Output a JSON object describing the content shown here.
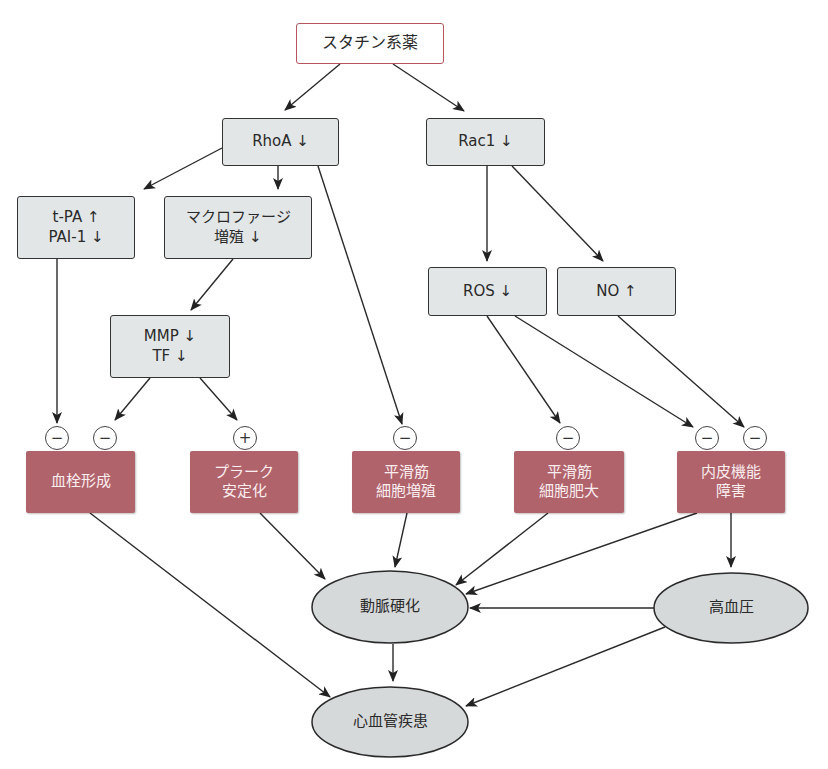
{
  "diagram": {
    "root": {
      "label": "スタチン系薬"
    },
    "level1": [
      {
        "id": "rhoa",
        "label": "RhoA ↓"
      },
      {
        "id": "rac1",
        "label": "Rac1 ↓"
      }
    ],
    "mediators": {
      "tpa": {
        "line1": "t-PA ↑",
        "line2": "PAI-1 ↓"
      },
      "macrophage": {
        "line1": "マクロファージ",
        "line2": "増殖 ↓"
      },
      "mmp": {
        "line1": "MMP ↓",
        "line2": "TF ↓"
      },
      "ros": {
        "label": "ROS ↓"
      },
      "no": {
        "label": "NO ↑"
      }
    },
    "effects": [
      {
        "id": "thrombus",
        "line1": "血栓形成",
        "line2": ""
      },
      {
        "id": "plaque",
        "line1": "プラーク",
        "line2": "安定化"
      },
      {
        "id": "smc_prolif",
        "line1": "平滑筋",
        "line2": "細胞増殖"
      },
      {
        "id": "smc_hyper",
        "line1": "平滑筋",
        "line2": "細胞肥大"
      },
      {
        "id": "endothelial",
        "line1": "内皮機能",
        "line2": "障害"
      }
    ],
    "signs": {
      "thrombus_a": "−",
      "thrombus_b": "−",
      "plaque": "+",
      "smc_prolif": "−",
      "smc_hyper": "−",
      "endothelial_a": "−",
      "endothelial_b": "−"
    },
    "outcomes": [
      {
        "id": "atherosclerosis",
        "label": "動脈硬化"
      },
      {
        "id": "hypertension",
        "label": "高血圧"
      },
      {
        "id": "cvd",
        "label": "心血管疾患"
      }
    ],
    "edges": [
      [
        "スタチン系薬",
        "RhoA ↓"
      ],
      [
        "スタチン系薬",
        "Rac1 ↓"
      ],
      [
        "RhoA ↓",
        "t-PA ↑ / PAI-1 ↓"
      ],
      [
        "RhoA ↓",
        "マクロファージ増殖 ↓"
      ],
      [
        "RhoA ↓",
        "平滑筋細胞増殖 (−)"
      ],
      [
        "マクロファージ増殖 ↓",
        "MMP ↓ / TF ↓"
      ],
      [
        "t-PA ↑ / PAI-1 ↓",
        "血栓形成 (−)"
      ],
      [
        "MMP ↓ / TF ↓",
        "血栓形成 (−)"
      ],
      [
        "MMP ↓ / TF ↓",
        "プラーク安定化 (+)"
      ],
      [
        "Rac1 ↓",
        "ROS ↓"
      ],
      [
        "Rac1 ↓",
        "NO ↑"
      ],
      [
        "ROS ↓",
        "平滑筋細胞肥大 (−)"
      ],
      [
        "ROS ↓",
        "内皮機能障害 (−)"
      ],
      [
        "NO ↑",
        "内皮機能障害 (−)"
      ],
      [
        "血栓形成",
        "心血管疾患"
      ],
      [
        "プラーク安定化",
        "動脈硬化"
      ],
      [
        "平滑筋細胞増殖",
        "動脈硬化"
      ],
      [
        "平滑筋細胞肥大",
        "動脈硬化"
      ],
      [
        "内皮機能障害",
        "動脈硬化"
      ],
      [
        "内皮機能障害",
        "高血圧"
      ],
      [
        "高血圧",
        "動脈硬化"
      ],
      [
        "高血圧",
        "心血管疾患"
      ],
      [
        "動脈硬化",
        "心血管疾患"
      ]
    ],
    "colors": {
      "effect_fill": "#b0636b",
      "mediator_fill": "#e3e6e7",
      "root_border": "#b5565f",
      "ellipse_fill": "#d6d9da"
    }
  }
}
